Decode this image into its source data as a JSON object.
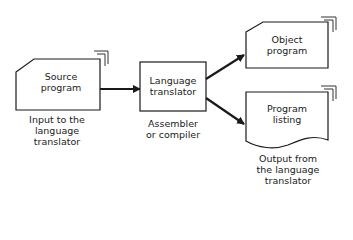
{
  "nodes": {
    "source": {
      "line1": "Source",
      "line2": "program",
      "caption": [
        "Input to the",
        "language",
        "translator"
      ]
    },
    "translator": {
      "line1": "Language",
      "line2": "translator",
      "caption": [
        "Assembler",
        "or compiler"
      ]
    },
    "object": {
      "line1": "Object",
      "line2": "program"
    },
    "listing": {
      "line1": "Program",
      "line2": "listing",
      "caption": [
        "Output from",
        "the language",
        "translator"
      ]
    }
  },
  "edges": [
    {
      "from": "source",
      "to": "translator"
    },
    {
      "from": "translator",
      "to": "object"
    },
    {
      "from": "translator",
      "to": "listing"
    }
  ],
  "colors": {
    "stroke": "#1a1a1a",
    "background": "#ffffff"
  }
}
